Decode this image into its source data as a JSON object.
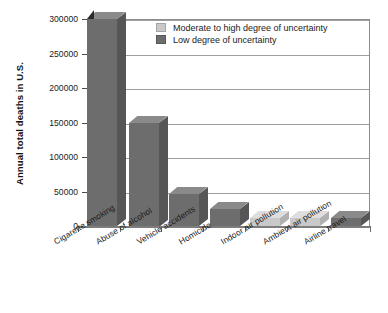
{
  "chart_data": {
    "type": "bar",
    "title": "",
    "subtitle": "",
    "xlabel": "",
    "ylabel": "Annual total deaths in U.S.",
    "ylim": [
      0,
      300000
    ],
    "ytick_values": [
      0,
      50000,
      100000,
      150000,
      200000,
      250000,
      300000
    ],
    "ytick_labels": [
      "0",
      "50000",
      "100000",
      "150000",
      "200000",
      "250000",
      "300000"
    ],
    "grid": true,
    "legend_position": "top-right",
    "categories": [
      "Cigarette smoking",
      "Abuse of alcohol",
      "Vehicle accidents",
      "Homicide",
      "Indoor air pollution",
      "Ambient air pollution",
      "Airline travel"
    ],
    "values": [
      300000,
      150000,
      46000,
      25000,
      11000,
      11000,
      11000
    ],
    "uncertainty": [
      "low",
      "low",
      "low",
      "low",
      "moderate-high",
      "moderate-high",
      "low"
    ],
    "truncated_bars": [
      "Cigarette smoking",
      "Indoor air pollution",
      "Ambient air pollution",
      "Airline travel"
    ],
    "legend": [
      {
        "label": "Moderate to high degree of uncertainty",
        "color": "#c9c9c9",
        "key": "moderate-high"
      },
      {
        "label": "Low degree of uncertainty",
        "color": "#6d6d6d",
        "key": "low"
      }
    ],
    "colors": {
      "low": "#6d6d6d",
      "low_top": "#8a8a8a",
      "low_side": "#565656",
      "moderate_high": "#c9c9c9",
      "moderate_high_top": "#dedede",
      "moderate_high_side": "#b0b0b0",
      "grid": "#9e9e9e",
      "axis": "#8d8d8d",
      "text": "#1a1a1a"
    }
  }
}
